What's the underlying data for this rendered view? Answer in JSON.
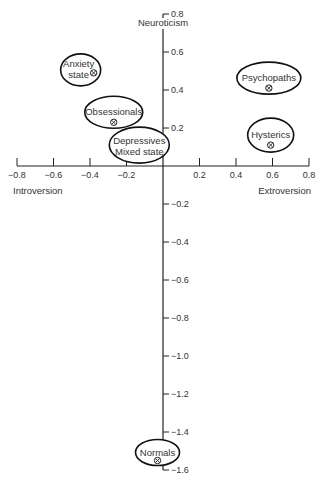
{
  "chart_data": {
    "type": "scatter",
    "title": "",
    "xlabel_left": "Introversion",
    "xlabel_right": "Extroversion",
    "ylabel": "Neuroticism",
    "xlim": [
      -0.8,
      0.8
    ],
    "ylim": [
      -1.6,
      0.8
    ],
    "grid": false,
    "x_ticks": [
      -0.8,
      -0.6,
      -0.4,
      -0.2,
      0.2,
      0.4,
      0.6,
      0.8
    ],
    "x_tick_labels": [
      "−0.8",
      "−0.6",
      "−0.4",
      "−0.2",
      "0.2",
      "0.4",
      "0.6",
      "0.8"
    ],
    "y_ticks": [
      0.8,
      0.6,
      0.4,
      0.2,
      -0.2,
      -0.4,
      -0.6,
      -0.8,
      -1.0,
      -1.2,
      -1.4,
      -1.6
    ],
    "y_tick_labels": [
      "0.8",
      "0.6",
      "0.4",
      "0.2",
      "−0.2",
      "−0.4",
      "−0.6",
      "−0.8",
      "−1.0",
      "−1.2",
      "−1.4",
      "−1.6"
    ],
    "groups": [
      {
        "name": "Anxiety state",
        "lines": [
          "Anxiety",
          "state"
        ],
        "x": -0.38,
        "y": 0.49,
        "marker": true
      },
      {
        "name": "Obsessionals",
        "lines": [
          "Obsessionals"
        ],
        "x": -0.27,
        "y": 0.23,
        "marker": true
      },
      {
        "name": "Depressives / Mixed state",
        "lines": [
          "Depressives",
          "Mixed state"
        ],
        "x": -0.13,
        "y": 0.11,
        "marker": false
      },
      {
        "name": "Psychopaths",
        "lines": [
          "Psychopaths"
        ],
        "x": 0.58,
        "y": 0.41,
        "marker": true
      },
      {
        "name": "Hysterics",
        "lines": [
          "Hysterics"
        ],
        "x": 0.59,
        "y": 0.11,
        "marker": true
      },
      {
        "name": "Normals",
        "lines": [
          "Normals"
        ],
        "x": -0.03,
        "y": -1.55,
        "marker": true
      }
    ]
  }
}
